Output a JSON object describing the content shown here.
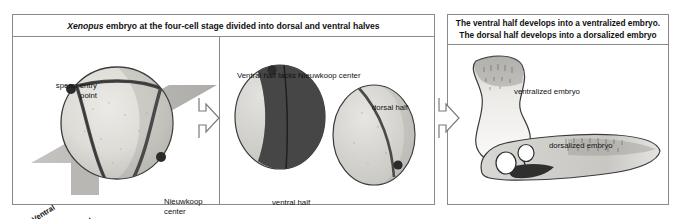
{
  "figure": {
    "left_panel": {
      "header": {
        "italic_word": "Xenopus",
        "rest": " embryo at the four-cell stage divided into dorsal and ventral halves"
      },
      "four_cell_view": {
        "sperm_entry_label": "sperm entry\npoint",
        "nieuwkoop_label": "Nieuwkoop\ncenter",
        "ventral_plane_label": "Ventral",
        "dorsal_plane_label": "Dorsal"
      },
      "halves_view": {
        "caption": "Ventral half lacks Nieuwkoop center",
        "ventral_half_label": "ventral half",
        "dorsal_half_label": "dorsal half"
      }
    },
    "right_panel": {
      "header_line_1": "The ventral half develops into a ventralized embryo.",
      "header_line_2": "The dorsal half develops into a dorsalized embryo",
      "ventralized_label": "ventralized embryo",
      "dorsalized_label": "dorsalized embryo"
    },
    "arrows": {
      "arrow_1_name": "arrow-left-to-middle",
      "arrow_2_name": "arrow-middle-to-right"
    },
    "colors": {
      "border": "#8a8a8a",
      "text": "#111111",
      "embryo_light": "#d8d6d2",
      "embryo_dark": "#4a4a4a",
      "plane_gray": "#b9b7b3",
      "marker_dot": "#2b2b2b",
      "outline": "#3a3a3a"
    }
  }
}
